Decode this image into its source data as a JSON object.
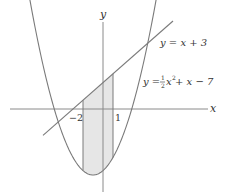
{
  "diagram": {
    "type": "function-graph",
    "axes": {
      "x_label": "x",
      "y_label": "y"
    },
    "curves": [
      {
        "name": "line",
        "label": "y = x + 3",
        "expression": "x + 3"
      },
      {
        "name": "parabola",
        "label_prefix": "y = ",
        "label_frac_num": "1",
        "label_frac_den": "2",
        "label_var": "x",
        "label_exp": "2",
        "label_suffix": " + x − 7",
        "expression": "0.5*x^2 + x - 7"
      }
    ],
    "shaded_region": {
      "x_from": -2,
      "x_to": 1,
      "between": [
        "y = x + 3",
        "y = ½x² + x − 7"
      ]
    },
    "tick_labels": {
      "left": "−2",
      "right": "1"
    },
    "colors": {
      "curve": "#7a7a7a",
      "axis": "#8a8a8a",
      "shade": "#e6e6e6",
      "text": "#333333"
    }
  }
}
